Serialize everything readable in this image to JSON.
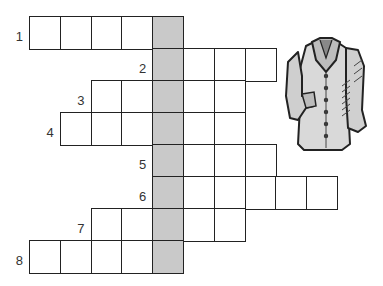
{
  "puzzle": {
    "type": "crossword",
    "key_column": 4,
    "key_color": "#c9c9c9",
    "grid_origin": {
      "x": 29,
      "y": 16
    },
    "cell_size": {
      "w": 30.8,
      "h": 32
    },
    "rows": [
      {
        "number": "1",
        "start_col": 0,
        "length": 5
      },
      {
        "number": "2",
        "start_col": 4,
        "length": 4
      },
      {
        "number": "3",
        "start_col": 2,
        "length": 5
      },
      {
        "number": "4",
        "start_col": 1,
        "length": 6
      },
      {
        "number": "5",
        "start_col": 4,
        "length": 4
      },
      {
        "number": "6",
        "start_col": 4,
        "length": 6
      },
      {
        "number": "7",
        "start_col": 2,
        "length": 5
      },
      {
        "number": "8",
        "start_col": 0,
        "length": 5
      }
    ]
  },
  "illustration": {
    "icon": "jacket-icon",
    "description": "shirt / jacket drawing"
  }
}
